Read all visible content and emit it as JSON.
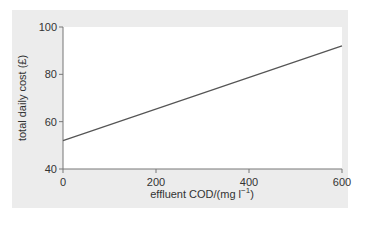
{
  "chart_data": {
    "type": "line",
    "title": "",
    "xlabel": "effluent COD/(mg l⁻¹)",
    "ylabel": "total daily cost (£)",
    "xlim": [
      0,
      600
    ],
    "ylim": [
      40,
      100
    ],
    "xticks": [
      0,
      200,
      400,
      600
    ],
    "yticks": [
      40,
      60,
      80,
      100
    ],
    "grid": false,
    "legend": null,
    "series": [
      {
        "name": "total daily cost",
        "x": [
          0,
          600
        ],
        "y": [
          52,
          92
        ]
      }
    ]
  },
  "labels": {
    "xlabel_main": "effluent COD/(mg l",
    "xlabel_sup": "−1",
    "xlabel_end": ")",
    "ylabel": "total daily cost (£)",
    "xticks": [
      "0",
      "200",
      "400",
      "600"
    ],
    "yticks": [
      "40",
      "60",
      "80",
      "100"
    ]
  },
  "colors": {
    "panel": "#ececec",
    "plot_bg": "#ffffff",
    "line": "#555555",
    "axis": "#777777"
  }
}
